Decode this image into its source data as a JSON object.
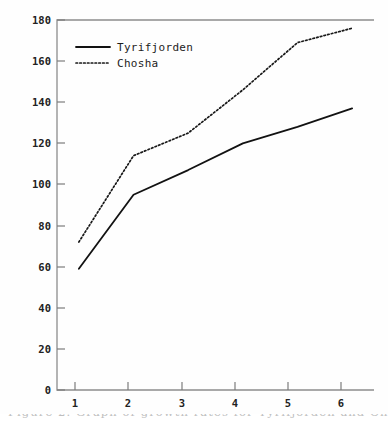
{
  "chart_data": {
    "type": "line",
    "title": "",
    "subtitle": "",
    "xlabel": "",
    "ylabel": "",
    "x": [
      1,
      2,
      3,
      4,
      5,
      6
    ],
    "categories": [
      "1",
      "2",
      "3",
      "4",
      "5",
      "6"
    ],
    "xlim": [
      0.6,
      6.4
    ],
    "ylim": [
      0,
      180
    ],
    "xticks": [
      "1",
      "2",
      "3",
      "4",
      "5",
      "6"
    ],
    "yticks": [
      "0",
      "20",
      "40",
      "60",
      "80",
      "100",
      "120",
      "140",
      "160",
      "180"
    ],
    "grid": false,
    "legend_position": "upper-left",
    "series": [
      {
        "name": "Tyrifjorden",
        "style": "solid",
        "color": "#121212",
        "values": [
          59,
          95,
          107,
          120,
          128,
          137
        ]
      },
      {
        "name": "Chosha",
        "style": "dotted",
        "color": "#181818",
        "values": [
          72,
          114,
          125,
          146,
          169,
          176
        ]
      }
    ]
  },
  "legend": {
    "entries": [
      {
        "label": "Tyrifjorden",
        "swatch": "solid-line-swatch"
      },
      {
        "label": "Chosha",
        "swatch": "dotted-line-swatch"
      }
    ]
  },
  "axes": {
    "y_tick_labels": [
      "180",
      "160",
      "140",
      "120",
      "100",
      "80",
      "60",
      "40",
      "20",
      "0"
    ],
    "x_tick_labels": [
      "1",
      "2",
      "3",
      "4",
      "5",
      "6"
    ]
  },
  "caption": {
    "text": "Figure 2. Graph of growth rates for Tyrifjorden and Chosha populations."
  }
}
